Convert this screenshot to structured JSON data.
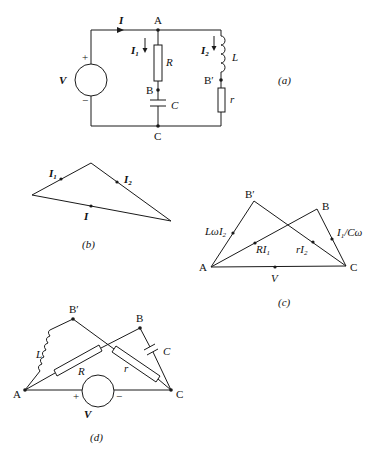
{
  "figure_a": {
    "caption": "(a)",
    "nodes": {
      "A": "A",
      "B": "B",
      "B_prime": "B′",
      "C": "C"
    },
    "current_I": "I",
    "current_I1": "I",
    "current_I1_sub": "1",
    "current_I2": "I",
    "current_I2_sub": "2",
    "source": "V",
    "plus": "+",
    "minus": "−",
    "resistor_R": "R",
    "capacitor_C": "C",
    "inductor_L": "L",
    "resistor_r": "r"
  },
  "figure_b": {
    "caption": "(b)",
    "I1": "I",
    "I1_sub": "1",
    "I2": "I",
    "I2_sub": "2",
    "I": "I"
  },
  "figure_c": {
    "caption": "(c)",
    "A": "A",
    "B": "B",
    "B_prime": "B′",
    "C": "C",
    "LwI2": "LωI",
    "LwI2_sub": "2",
    "RI1": "RI",
    "RI1_sub": "1",
    "rI2": "rI",
    "rI2_sub": "2",
    "I1_over_Cw": "I",
    "I1_over_Cw_sub": "1",
    "I1_over_Cw_tail": "/Cω",
    "V": "V"
  },
  "figure_d": {
    "caption": "(d)",
    "A": "A",
    "B": "B",
    "B_prime": "B′",
    "C": "C",
    "L": "L",
    "R": "R",
    "r": "r",
    "Cap": "C",
    "V": "V",
    "plus": "+",
    "minus": "−"
  }
}
